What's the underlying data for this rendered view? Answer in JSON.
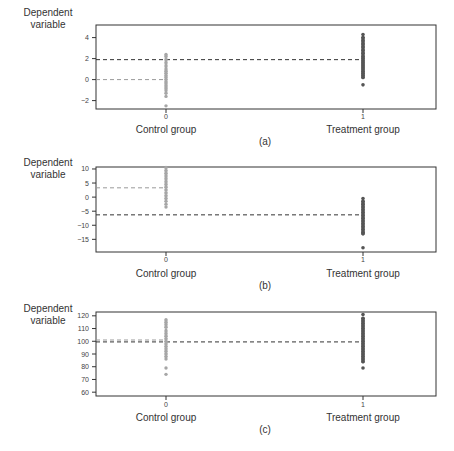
{
  "figure": {
    "ylabel_line1": "Dependent",
    "ylabel_line2": "variable",
    "x_tick_control": "0",
    "x_tick_treatment": "1",
    "x_label_control": "Control group",
    "x_label_treatment": "Treatment group",
    "colors": {
      "control": "#a6a6a6",
      "treatment": "#555555",
      "control_mean_line": "#9a9a9a",
      "treatment_mean_line": "#333333",
      "axis": "#333333"
    }
  },
  "chart_data": [
    {
      "type": "scatter",
      "panel": "(a)",
      "title": "",
      "xlabel": "Control group / Treatment group",
      "ylabel": "Dependent variable",
      "categories": [
        "0",
        "1"
      ],
      "ylim": [
        -2.8,
        5.2
      ],
      "yticks": [
        -2,
        0,
        2,
        4
      ],
      "ytick_labels": [
        "−2",
        "0",
        "2",
        "4"
      ],
      "grid": false,
      "series": [
        {
          "name": "Control group",
          "x": 0,
          "mean": 0.0,
          "values": [
            2.4,
            2.2,
            1.9,
            1.6,
            1.3,
            1.0,
            0.8,
            0.6,
            0.4,
            0.2,
            0.0,
            -0.2,
            -0.4,
            -0.6,
            -0.8,
            -1.0,
            -1.3,
            -1.6,
            -2.5
          ]
        },
        {
          "name": "Treatment group",
          "x": 1,
          "mean": 1.9,
          "values": [
            4.3,
            4.0,
            3.7,
            3.4,
            3.1,
            2.8,
            2.5,
            2.2,
            2.0,
            1.8,
            1.6,
            1.4,
            1.2,
            1.0,
            0.8,
            0.6,
            0.4,
            0.2,
            -0.5
          ]
        }
      ]
    },
    {
      "type": "scatter",
      "panel": "(b)",
      "title": "",
      "xlabel": "Control group / Treatment group",
      "ylabel": "Dependent variable",
      "categories": [
        "0",
        "1"
      ],
      "ylim": [
        -19.5,
        10.7
      ],
      "yticks": [
        -15,
        -10,
        -5,
        0,
        5,
        10
      ],
      "ytick_labels": [
        "−15",
        "−10",
        "−5",
        "0",
        "5",
        "10"
      ],
      "grid": false,
      "series": [
        {
          "name": "Control group",
          "x": 0,
          "mean": 3.3,
          "values": [
            10.5,
            9.5,
            8.5,
            7.5,
            6.5,
            5.5,
            4.5,
            3.5,
            2.5,
            1.5,
            0.5,
            -0.5,
            -1.5,
            -2.5,
            -3.5
          ]
        },
        {
          "name": "Treatment group",
          "x": 1,
          "mean": -6.3,
          "values": [
            -0.5,
            -1.5,
            -2.5,
            -3.5,
            -4.5,
            -5.5,
            -6.5,
            -7.5,
            -8.5,
            -9.5,
            -10.5,
            -11.5,
            -12.5,
            -13.0,
            -18.0
          ]
        }
      ]
    },
    {
      "type": "scatter",
      "panel": "(c)",
      "title": "",
      "xlabel": "Control group / Treatment group",
      "ylabel": "Dependent variable",
      "categories": [
        "0",
        "1"
      ],
      "ylim": [
        57,
        123
      ],
      "yticks": [
        60,
        70,
        80,
        90,
        100,
        110,
        120
      ],
      "ytick_labels": [
        "60",
        "70",
        "80",
        "90",
        "100",
        "110",
        "120"
      ],
      "grid": false,
      "series": [
        {
          "name": "Control group",
          "x": 0,
          "mean": 101,
          "values": [
            117,
            115,
            113,
            111,
            108,
            106,
            104,
            102,
            100,
            98,
            96,
            94,
            92,
            90,
            88,
            86,
            79,
            74
          ]
        },
        {
          "name": "Treatment group",
          "x": 1,
          "mean": 99.5,
          "values": [
            121,
            118,
            116,
            114,
            112,
            110,
            108,
            106,
            104,
            102,
            100,
            98,
            96,
            94,
            92,
            90,
            88,
            86,
            84,
            79
          ]
        }
      ]
    }
  ]
}
